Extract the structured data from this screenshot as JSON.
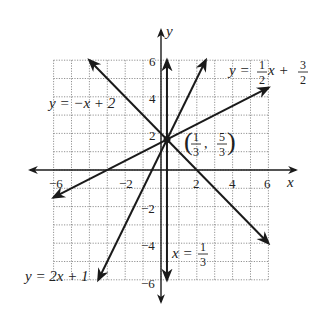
{
  "chart_data": {
    "type": "line",
    "title": "",
    "xlabel": "x",
    "ylabel": "y",
    "xlim": [
      -6,
      6
    ],
    "ylim": [
      -6,
      6
    ],
    "grid": true,
    "x_ticks": [
      "-6",
      "-2",
      "2",
      "4",
      "6"
    ],
    "y_ticks": [
      "6",
      "4",
      "2",
      "-2",
      "-4",
      "-6"
    ],
    "series": [
      {
        "name": "y = -x + 2",
        "equation": "y=-x+2",
        "points": [
          [
            -4,
            6
          ],
          [
            6,
            -4
          ]
        ]
      },
      {
        "name": "y = 2x + 1",
        "equation": "y=2x+1",
        "points": [
          [
            -3.5,
            -6
          ],
          [
            2.5,
            6
          ]
        ]
      },
      {
        "name": "y = 1/2 x + 3/2",
        "equation": "y=0.5x+1.5",
        "points": [
          [
            -6,
            -1.5
          ],
          [
            6,
            4.5
          ]
        ]
      },
      {
        "name": "x = 1/3",
        "equation": "x=1/3",
        "points": [
          [
            0.3333,
            6
          ],
          [
            0.3333,
            -6
          ]
        ]
      }
    ],
    "annotations": [
      {
        "text": "(1/3, 5/3)",
        "x": 0.3333,
        "y": 1.6667,
        "note": "intersection point"
      }
    ]
  },
  "labels": {
    "x_axis": "x",
    "y_axis": "y",
    "tick_x_neg6": "−6",
    "tick_x_neg2": "−2",
    "tick_x_2": "2",
    "tick_x_4": "4",
    "tick_x_6": "6",
    "tick_y_6": "6",
    "tick_y_4": "4",
    "tick_y_2": "2",
    "tick_y_neg2": "−2",
    "tick_y_neg4": "−4",
    "tick_y_neg6": "−6",
    "eq1_lhs": "y = −x + 2",
    "eq2_lhs": "y = 2x + 1",
    "eq3_y": "y =",
    "eq3_num1": "1",
    "eq3_den1": "2",
    "eq3_x": "x +",
    "eq3_num2": "3",
    "eq3_den2": "2",
    "eq4_x": "x =",
    "eq4_num": "1",
    "eq4_den": "3",
    "pt_num1": "1",
    "pt_den1": "3",
    "pt_num2": "5",
    "pt_den2": "3",
    "pt_comma": ","
  }
}
